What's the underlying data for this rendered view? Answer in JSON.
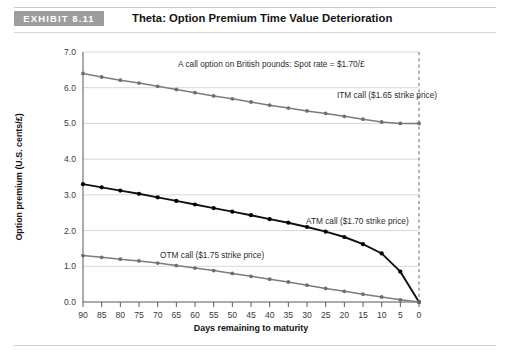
{
  "header": {
    "badge": "EXHIBIT 8.11",
    "title": "Theta: Option Premium Time Value Deterioration"
  },
  "chart_data": {
    "type": "line",
    "title": "Theta: Option Premium Time Value Deterioration",
    "xlabel": "Days remaining to maturity",
    "ylabel": "Option premium (U.S. cents/£)",
    "xlim": [
      90,
      0
    ],
    "ylim": [
      0.0,
      7.0
    ],
    "x_tick_labels": [
      "90",
      "85",
      "80",
      "75",
      "70",
      "65",
      "60",
      "55",
      "50",
      "45",
      "40",
      "35",
      "30",
      "25",
      "20",
      "15",
      "10",
      "5",
      "0"
    ],
    "y_tick_labels": [
      "0.0",
      "1.0",
      "2.0",
      "3.0",
      "4.0",
      "5.0",
      "6.0",
      "7.0"
    ],
    "grid": true,
    "legend": "inline-annotations",
    "x": [
      90,
      85,
      80,
      75,
      70,
      65,
      60,
      55,
      50,
      45,
      40,
      35,
      30,
      25,
      20,
      15,
      10,
      5,
      0
    ],
    "series": [
      {
        "name": "ITM call ($1.65 strike price)",
        "color": "#7c7c7e",
        "values": [
          6.4,
          6.3,
          6.21,
          6.13,
          6.04,
          5.95,
          5.86,
          5.77,
          5.69,
          5.6,
          5.51,
          5.43,
          5.35,
          5.28,
          5.2,
          5.12,
          5.04,
          5.0,
          5.0
        ]
      },
      {
        "name": "ATM call ($1.70 strike price)",
        "color": "#111111",
        "values": [
          3.3,
          3.21,
          3.12,
          3.03,
          2.93,
          2.83,
          2.73,
          2.63,
          2.53,
          2.43,
          2.32,
          2.22,
          2.1,
          1.97,
          1.82,
          1.62,
          1.36,
          0.85,
          0.0
        ]
      },
      {
        "name": "OTM call ($1.75 strike price)",
        "color": "#7c7c7e",
        "values": [
          1.3,
          1.25,
          1.2,
          1.15,
          1.09,
          1.02,
          0.95,
          0.88,
          0.8,
          0.72,
          0.64,
          0.56,
          0.47,
          0.38,
          0.3,
          0.22,
          0.14,
          0.06,
          0.0
        ]
      }
    ],
    "annotations": [
      {
        "id": "spot-rate-note",
        "text": "A call option on British pounds: Spot rate = $1.70/£"
      },
      {
        "id": "itm-label",
        "text": "ITM call ($1.65 strike price)"
      },
      {
        "id": "atm-label",
        "text": "ATM call ($1.70 strike price)"
      },
      {
        "id": "otm-label",
        "text": "OTM call ($1.75 strike price)"
      }
    ]
  }
}
